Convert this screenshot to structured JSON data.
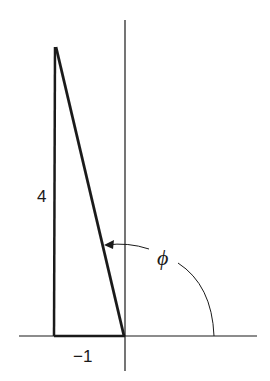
{
  "diagram": {
    "type": "vector-angle-diagram",
    "labels": {
      "vertical_side": "4",
      "horizontal_side": "−1",
      "angle": "ϕ"
    },
    "triangle": {
      "vertices": [
        [
          -1,
          0
        ],
        [
          -1,
          4
        ],
        [
          0,
          0
        ]
      ],
      "legs": {
        "horizontal": -1,
        "vertical": 4
      }
    },
    "axes": {
      "x": true,
      "y": true
    },
    "colors": {
      "line": "#1a1a1a",
      "background": "#ffffff"
    }
  }
}
